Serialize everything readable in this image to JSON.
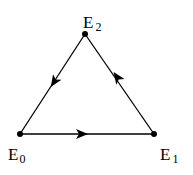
{
  "diagram": {
    "type": "directed-cycle-triangle",
    "nodes": [
      {
        "id": "E0",
        "label": "E",
        "subscript": "0",
        "x": 20,
        "y": 134
      },
      {
        "id": "E1",
        "label": "E",
        "subscript": "1",
        "x": 154,
        "y": 134
      },
      {
        "id": "E2",
        "label": "E",
        "subscript": "2",
        "x": 85,
        "y": 34
      }
    ],
    "edges": [
      {
        "from": "E0",
        "to": "E1"
      },
      {
        "from": "E1",
        "to": "E2"
      },
      {
        "from": "E2",
        "to": "E0"
      }
    ],
    "colors": {
      "line": "#000000",
      "background": "#ffffff"
    }
  }
}
